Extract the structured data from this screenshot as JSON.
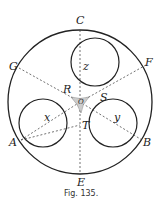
{
  "figure": {
    "caption": "Fig. 135.",
    "points": {
      "C": "C",
      "G": "G",
      "F": "F",
      "R": "R",
      "S": "S",
      "O": "O",
      "A": "A",
      "B": "B",
      "T": "T",
      "E": "E"
    },
    "variables": {
      "x": "x",
      "y": "y",
      "z": "z"
    }
  }
}
